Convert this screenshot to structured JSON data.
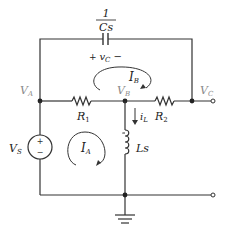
{
  "diagram": {
    "type": "circuit",
    "capacitor": {
      "impedance_num": "1",
      "impedance_den": "Cs",
      "voltage_label": "+ v",
      "voltage_sub": "C",
      "voltage_minus": "−"
    },
    "nodes": {
      "A": {
        "label": "V",
        "sub": "A"
      },
      "B": {
        "label": "V",
        "sub": "B"
      },
      "C": {
        "label": "V",
        "sub": "C"
      }
    },
    "resistors": {
      "R1": {
        "label": "R",
        "sub": "1"
      },
      "R2": {
        "label": "R",
        "sub": "2"
      }
    },
    "inductor": {
      "label": "Ls"
    },
    "source": {
      "label": "V",
      "sub": "S",
      "plus": "+",
      "minus": "−"
    },
    "mesh_currents": {
      "IA": {
        "label": "I",
        "sub": "A"
      },
      "IB": {
        "label": "I",
        "sub": "B"
      }
    },
    "branch_current": {
      "label": "i",
      "sub": "L"
    },
    "colors": {
      "wire": "#333333",
      "node_label": "#8a8a8a",
      "text": "#222222"
    }
  }
}
